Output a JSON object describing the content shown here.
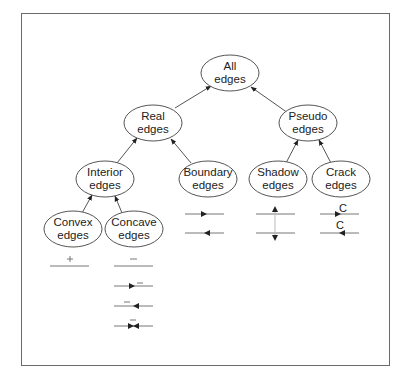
{
  "diagram": {
    "type": "edge-classification-tree",
    "nodes": [
      {
        "id": "all",
        "line1": "All",
        "line2": "edges"
      },
      {
        "id": "real",
        "line1": "Real",
        "line2": "edges"
      },
      {
        "id": "pseudo",
        "line1": "Pseudo",
        "line2": "edges"
      },
      {
        "id": "interior",
        "line1": "Interior",
        "line2": "edges"
      },
      {
        "id": "boundary",
        "line1": "Boundary",
        "line2": "edges"
      },
      {
        "id": "shadow",
        "line1": "Shadow",
        "line2": "edges"
      },
      {
        "id": "crack",
        "line1": "Crack",
        "line2": "edges"
      },
      {
        "id": "convex",
        "line1": "Convex",
        "line2": "edges"
      },
      {
        "id": "concave",
        "line1": "Concave",
        "line2": "edges"
      }
    ],
    "edges": [
      {
        "from": "real",
        "to": "all"
      },
      {
        "from": "pseudo",
        "to": "all"
      },
      {
        "from": "interior",
        "to": "real"
      },
      {
        "from": "boundary",
        "to": "real"
      },
      {
        "from": "shadow",
        "to": "pseudo"
      },
      {
        "from": "crack",
        "to": "pseudo"
      },
      {
        "from": "convex",
        "to": "interior"
      },
      {
        "from": "concave",
        "to": "interior"
      }
    ],
    "symbols": {
      "convex": [
        "+"
      ],
      "concave": [
        "−",
        "→ −",
        "− ←",
        "→← −"
      ],
      "boundary": [
        "→",
        "←"
      ],
      "shadow": [
        "↑",
        "↓"
      ],
      "crack": [
        "C →",
        "C ←"
      ]
    },
    "crack_label": "C",
    "convex_sign": "+",
    "concave_sign": "−"
  }
}
